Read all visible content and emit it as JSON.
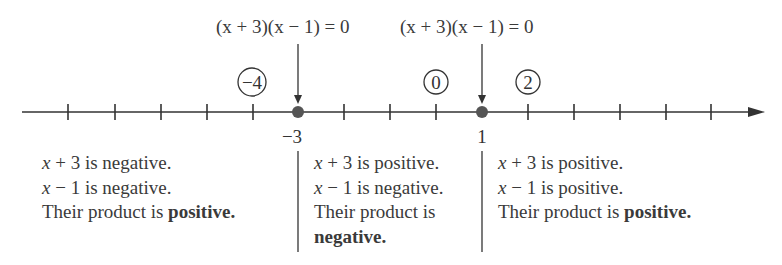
{
  "equations": [
    {
      "text": "(x + 3)(x − 1) = 0",
      "x_var": "x"
    },
    {
      "text": "(x + 3)(x − 1) = 0",
      "x_var": "x"
    }
  ],
  "number_line": {
    "tick_spacing_px": 46,
    "critical_points": [
      {
        "value": "−3",
        "x": 298
      },
      {
        "value": "1",
        "x": 482
      }
    ],
    "test_points": [
      {
        "label": "−4",
        "x": 252
      },
      {
        "label": "0",
        "x": 436
      },
      {
        "label": "2",
        "x": 528
      }
    ]
  },
  "regions": [
    {
      "line1_var": "x",
      "line1_rest": " + 3 is negative.",
      "line2_var": "x",
      "line2_rest": " − 1 is negative.",
      "line3": "Their product is ",
      "line3_bold": "positive."
    },
    {
      "line1_var": "x",
      "line1_rest": " + 3 is positive.",
      "line2_var": "x",
      "line2_rest": " − 1 is negative.",
      "line3": "Their product is",
      "line3_bold": "negative."
    },
    {
      "line1_var": "x",
      "line1_rest": " + 3 is positive.",
      "line2_var": "x",
      "line2_rest": " − 1 is positive.",
      "line3": "Their product is ",
      "line3_bold": "positive."
    }
  ]
}
